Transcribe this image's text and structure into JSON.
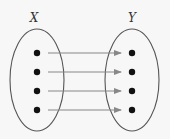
{
  "diagram": {
    "type": "function-mapping",
    "sets": [
      {
        "label": "X",
        "cx": 37,
        "cy": 80,
        "rx": 27,
        "ry": 51,
        "label_x": 34,
        "label_y": 22,
        "elements": [
          {
            "x": 37,
            "y": 53
          },
          {
            "x": 37,
            "y": 72
          },
          {
            "x": 37,
            "y": 91
          },
          {
            "x": 37,
            "y": 110
          }
        ]
      },
      {
        "label": "Y",
        "cx": 132,
        "cy": 80,
        "rx": 27,
        "ry": 51,
        "label_x": 132,
        "label_y": 22,
        "elements": [
          {
            "x": 132,
            "y": 53
          },
          {
            "x": 132,
            "y": 72
          },
          {
            "x": 132,
            "y": 91
          },
          {
            "x": 132,
            "y": 110
          }
        ]
      }
    ],
    "arrows": [
      {
        "from": 0,
        "to": 0,
        "x1": 48,
        "x2": 121,
        "y": 53
      },
      {
        "from": 1,
        "to": 1,
        "x1": 48,
        "x2": 121,
        "y": 72
      },
      {
        "from": 2,
        "to": 2,
        "x1": 48,
        "x2": 121,
        "y": 91
      },
      {
        "from": 3,
        "to": 3,
        "x1": 48,
        "x2": 121,
        "y": 110
      }
    ],
    "colors": {
      "ellipse": "#555555",
      "arrow": "#888888",
      "dot": "#111111",
      "label": "#333333"
    }
  }
}
